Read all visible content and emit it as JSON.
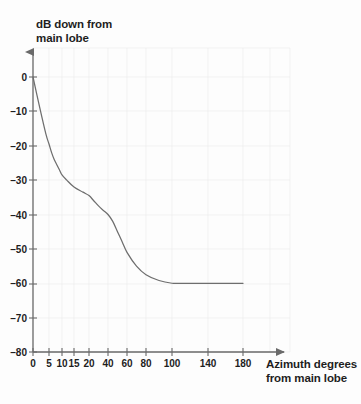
{
  "figure": {
    "background_color": "#fdfdfd",
    "ink_color": "#5a5a5a",
    "text_color": "#1e1e1e",
    "grid_color": "#ebebeb"
  },
  "axes": {
    "y_title": "dB down from\nmain lobe",
    "x_title": "Azimuth degrees\nfrom main lobe",
    "y_ticks": [
      "0",
      "-10",
      "-20",
      "-30",
      "-40",
      "-50",
      "-60",
      "-70",
      "-80"
    ],
    "x_ticks": [
      "0",
      "5",
      "10",
      "15",
      "20",
      "40",
      "60",
      "80",
      "100",
      "140",
      "180"
    ]
  },
  "chart_data": {
    "type": "line",
    "title": "",
    "subtitle": "",
    "xlabel": "Azimuth degrees from main lobe",
    "ylabel": "dB down from main lobe",
    "xlim": [
      0,
      180
    ],
    "ylim": [
      -80,
      0
    ],
    "grid": true,
    "legend": null,
    "x_scale": "nonlinear-compressed",
    "x_tick_values": [
      0,
      5,
      10,
      15,
      20,
      40,
      60,
      80,
      100,
      140,
      180
    ],
    "x_tick_labels": [
      "0",
      "5",
      "10",
      "15",
      "20",
      "40",
      "60",
      "80",
      "100",
      "140",
      "180"
    ],
    "y_tick_values": [
      0,
      -10,
      -20,
      -30,
      -40,
      -50,
      -60,
      -70,
      -80
    ],
    "y_tick_labels": [
      "0",
      "-10",
      "-20",
      "-30",
      "-40",
      "-50",
      "-60",
      "-70",
      "-80"
    ],
    "series": [
      {
        "name": "Sidelobe envelope",
        "x": [
          0,
          2,
          4,
          5,
          6,
          7,
          8,
          9,
          10,
          12,
          15,
          18,
          20,
          25,
          30,
          35,
          40,
          45,
          50,
          55,
          60,
          70,
          80,
          90,
          100,
          110,
          120,
          140,
          160,
          180
        ],
        "y": [
          0,
          -8.5,
          -16.5,
          -19.5,
          -22,
          -24,
          -25.5,
          -27,
          -28.5,
          -30,
          -32,
          -33.5,
          -34.5,
          -36,
          -37.5,
          -38.8,
          -40,
          -42,
          -45,
          -48,
          -51,
          -55,
          -57.5,
          -59.2,
          -60,
          -60,
          -60,
          -60,
          -60,
          -60
        ]
      }
    ],
    "annotations": [
      {
        "text": "floor at -60 dB beyond 100 degrees",
        "x": 100,
        "y": -60
      }
    ]
  }
}
